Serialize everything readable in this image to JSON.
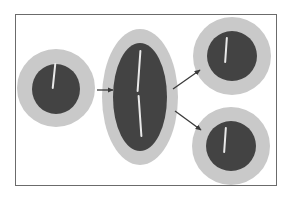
{
  "figure": {
    "title": "Cell division diagram",
    "background_color": "#ffffff",
    "frame": {
      "border_color": "#6b6b6b",
      "fill_color": "#ffffff",
      "x": 15,
      "y": 14,
      "width": 262,
      "height": 172
    }
  },
  "palette": {
    "cytoplasm": "#c9c9c9",
    "nucleus": "#434343",
    "chromosome": "#e9e9e9",
    "arrow": "#3a3a3a",
    "frame_border": "#6b6b6b",
    "background": "#ffffff"
  },
  "diagram": {
    "type": "cell-division-schematic",
    "stage_count": 4,
    "arrow_count": 3,
    "cells": [
      {
        "id": "parent-cell",
        "role": "parent",
        "shape": "circle",
        "cx": 56,
        "cy": 88,
        "rx": 39,
        "ry": 39,
        "nucleus": {
          "cx": 56,
          "cy": 89,
          "rx": 24,
          "ry": 25
        },
        "chromosomes": [
          {
            "x": 54,
            "y": 76,
            "length": 26,
            "angle": 6
          }
        ]
      },
      {
        "id": "enlarged-cell",
        "role": "enlarged",
        "shape": "ellipse",
        "cx": 140,
        "cy": 97,
        "rx": 38,
        "ry": 68,
        "nucleus": {
          "cx": 140,
          "cy": 97,
          "rx": 27,
          "ry": 54
        },
        "chromosomes": [
          {
            "x": 139,
            "y": 51,
            "length": 42,
            "angle": 4
          },
          {
            "x": 140,
            "y": 96,
            "length": 42,
            "angle": -4
          }
        ]
      },
      {
        "id": "daughter-cell-top",
        "role": "daughter",
        "shape": "circle",
        "cx": 232,
        "cy": 56,
        "rx": 39,
        "ry": 39,
        "nucleus": {
          "cx": 232,
          "cy": 56,
          "rx": 25,
          "ry": 25
        },
        "chromosomes": [
          {
            "x": 228,
            "y": 41,
            "length": 26,
            "angle": 4
          }
        ]
      },
      {
        "id": "daughter-cell-bottom",
        "role": "daughter",
        "shape": "circle",
        "cx": 231,
        "cy": 146,
        "rx": 39,
        "ry": 39,
        "nucleus": {
          "cx": 231,
          "cy": 146,
          "rx": 25,
          "ry": 25
        },
        "chromosomes": [
          {
            "x": 227,
            "y": 131,
            "length": 26,
            "angle": 4
          }
        ]
      }
    ],
    "arrows": [
      {
        "id": "arrow-parent-to-enlarged",
        "from": "parent-cell",
        "to": "enlarged-cell",
        "x1": 97,
        "y1": 90,
        "x2": 114,
        "y2": 90
      },
      {
        "id": "arrow-enlarged-to-top",
        "from": "enlarged-cell",
        "to": "daughter-cell-top",
        "x1": 173,
        "y1": 89,
        "x2": 201,
        "y2": 69
      },
      {
        "id": "arrow-enlarged-to-bottom",
        "from": "enlarged-cell",
        "to": "daughter-cell-bottom",
        "x1": 175,
        "y1": 111,
        "x2": 202,
        "y2": 131
      }
    ]
  }
}
